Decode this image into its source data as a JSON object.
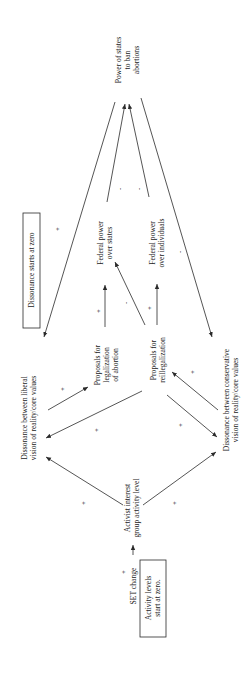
{
  "diagram": {
    "orientation": "rotated 90 degrees counterclockwise",
    "nodes": {
      "power_states": [
        "Power of states",
        "to ban",
        "abortions"
      ],
      "dissonance_note": "Dissonance starts at zero",
      "liberal_dissonance": [
        "Dissonance between liberal",
        "vision of reality/core values"
      ],
      "proposals_legalization": [
        "Proposals for",
        "legalization",
        "of abortion"
      ],
      "federal_states": [
        "Federal power",
        "over states"
      ],
      "federal_individuals": [
        "Federal power",
        "over individuals"
      ],
      "proposals_reillegalization": [
        "Proposals for",
        "reillegalization"
      ],
      "conservative_dissonance": [
        "Dissonance between conservative",
        "vision of reality/core values"
      ],
      "activist_level": [
        "Activist interest",
        "group activity level"
      ],
      "set_change": "SET change",
      "activity_note": [
        "Activity levels",
        "start at zero."
      ]
    },
    "signs": {
      "set_to_activist": "+",
      "activist_to_liberal": "+",
      "activist_to_conservative": "+",
      "liberal_to_legalization": "+",
      "reillegalization_to_liberal": "+",
      "legalization_to_conservative": "+",
      "conservative_to_reillegalization": "+",
      "legalization_to_fed_states": "+",
      "reillegalization_to_fed_states": "-",
      "reillegalization_to_fed_individuals": "+",
      "fed_states_to_power": "-",
      "fed_individuals_to_power": "-",
      "liberal_dissonance_loop": "+",
      "power_to_conservative": "-"
    }
  }
}
